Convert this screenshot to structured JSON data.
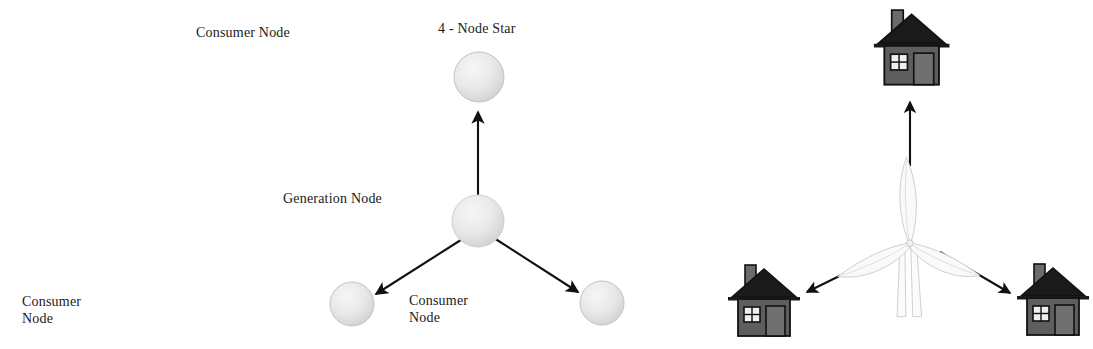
{
  "figure": {
    "background_color": "#ffffff",
    "width": 908,
    "height": 349,
    "stroke_color": "#111111",
    "node_fill_color": "#e8e8e8",
    "node_stroke_color": "#bdbdbd",
    "house_body_color": "#595959",
    "house_roof_color": "#1a1a1a",
    "house_outline_color": "#111111",
    "turbine_color": "#d4d4d4"
  },
  "left_diagram": {
    "name": "abstract-star-topology",
    "center_node": {
      "label": "Generation Node",
      "shape": "sphere"
    },
    "outer_nodes": [
      {
        "id": "top",
        "label": "Consumer Node",
        "shape": "sphere"
      },
      {
        "id": "bottom-left",
        "label": "Consumer\nNode",
        "shape": "sphere"
      },
      {
        "id": "bottom-right",
        "label": "Consumer\nNode",
        "shape": "sphere"
      }
    ],
    "edges": [
      {
        "from": "Generation Node",
        "to": "Consumer Node (top)",
        "direction": "outward",
        "arrowhead": true
      },
      {
        "from": "Generation Node",
        "to": "Consumer Node (bottom-left)",
        "direction": "outward",
        "arrowhead": true
      },
      {
        "from": "Generation Node",
        "to": "Consumer Node (bottom-right)",
        "direction": "outward",
        "arrowhead": true
      }
    ]
  },
  "right_diagram": {
    "name": "pictorial-star-topology",
    "title": "4 - Node Star",
    "center_icon": "wind-turbine-icon",
    "outer_icons": [
      {
        "id": "top",
        "icon": "house-icon"
      },
      {
        "id": "bottom-left",
        "icon": "house-icon"
      },
      {
        "id": "bottom-right",
        "icon": "house-icon"
      }
    ],
    "edges": [
      {
        "from": "wind-turbine",
        "to": "house-top",
        "direction": "outward",
        "arrowhead": true
      },
      {
        "from": "wind-turbine",
        "to": "house-bottom-left",
        "direction": "outward",
        "arrowhead": true
      },
      {
        "from": "wind-turbine",
        "to": "house-bottom-right",
        "direction": "outward",
        "arrowhead": true
      }
    ]
  }
}
